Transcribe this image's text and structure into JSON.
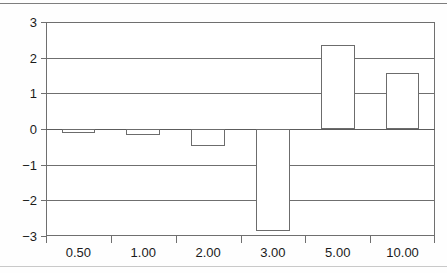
{
  "chart_data": {
    "type": "bar",
    "title": "",
    "subtitle": "",
    "xlabel": "",
    "ylabel": "",
    "categories": [
      "0.50",
      "1.00",
      "2.00",
      "3.00",
      "5.00",
      "10.00"
    ],
    "values": [
      -0.11,
      -0.17,
      -0.47,
      -2.87,
      2.35,
      1.57
    ],
    "series": [
      {
        "name": "",
        "values": [
          -0.11,
          -0.17,
          -0.47,
          -2.87,
          2.35,
          1.57
        ]
      }
    ],
    "ylim": [
      -3,
      3
    ],
    "yticks": [
      3,
      2,
      1,
      0,
      -1,
      -2,
      -3
    ],
    "ytick_labels": [
      "3",
      "2",
      "1",
      "0",
      "−1",
      "−2",
      "−3"
    ],
    "xtick_labels": [
      "0.50",
      "1.00",
      "2.00",
      "3.00",
      "5.00",
      "10.00"
    ],
    "grid": true,
    "grid_axis": "y",
    "legend": false,
    "legend_position": "none",
    "bar_fill_color": "#ffffff",
    "bar_edge_color": "#6c6c6c",
    "axis_color": "#6f6f6f",
    "text_color": "#1b1b1b",
    "background_color": "#ffffff"
  },
  "page": {
    "background_color": "#fefefe",
    "rule_color": "#7e7e7e"
  }
}
